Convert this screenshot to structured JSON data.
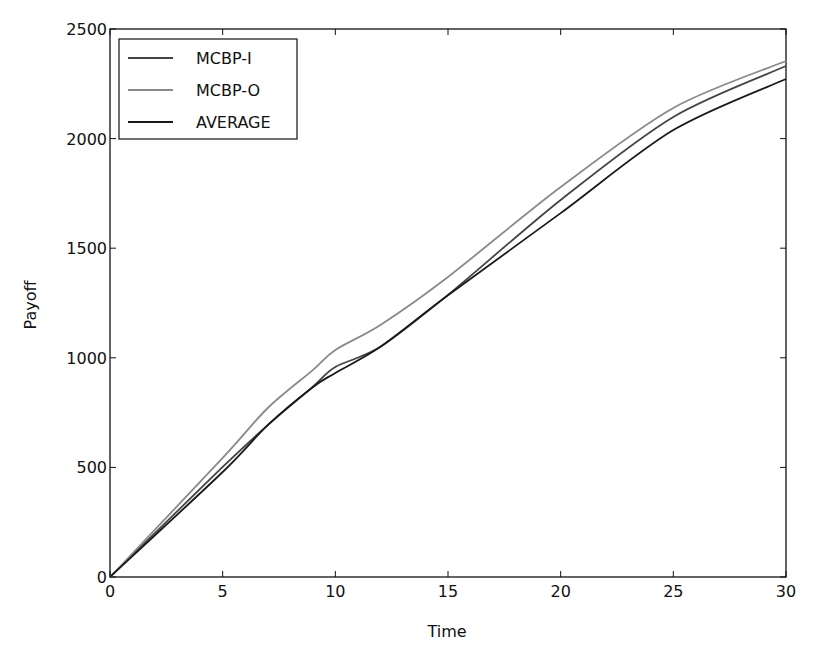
{
  "chart_data": {
    "type": "line",
    "title": "",
    "xlabel": "Time",
    "ylabel": "Payoff",
    "xlim": [
      0,
      30
    ],
    "ylim": [
      0,
      2500
    ],
    "xticks": [
      0,
      5,
      10,
      15,
      20,
      25,
      30
    ],
    "yticks": [
      0,
      500,
      1000,
      1500,
      2000,
      2500
    ],
    "grid": false,
    "legend_position": "upper left",
    "x": [
      0,
      5,
      7,
      9,
      10,
      12,
      15,
      20,
      25,
      30
    ],
    "series": [
      {
        "name": "MCBP-I",
        "color": "#444444",
        "values": [
          0,
          502,
          693,
          868,
          958,
          1050,
          1287,
          1720,
          2099,
          2331
        ]
      },
      {
        "name": "MCBP-O",
        "color": "#8a8a8a",
        "values": [
          0,
          543,
          771,
          944,
          1036,
          1150,
          1369,
          1779,
          2140,
          2354
        ]
      },
      {
        "name": "AVERAGE",
        "color": "#1a1a1a",
        "values": [
          0,
          479,
          693,
          866,
          931,
          1050,
          1285,
          1660,
          2039,
          2272
        ]
      }
    ]
  }
}
